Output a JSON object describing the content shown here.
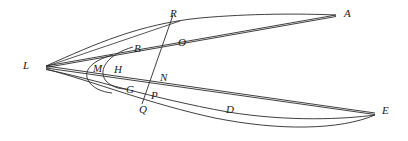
{
  "figure": {
    "kind": "geometry-diagram",
    "width": 408,
    "height": 141,
    "stroke_color": "#2b2b2b",
    "background_color": "#ffffff",
    "label_color": "#1a1a1a"
  },
  "points": [
    {
      "id": "A",
      "label": "A",
      "label_x": 344,
      "label_y": 8,
      "x": 336,
      "y": 15
    },
    {
      "id": "R",
      "label": "R",
      "label_x": 170,
      "label_y": 8,
      "x": 172,
      "y": 22
    },
    {
      "id": "O",
      "label": "O",
      "label_x": 178,
      "label_y": 37,
      "x": 175,
      "y": 38
    },
    {
      "id": "B",
      "label": "B",
      "label_x": 134,
      "label_y": 43,
      "x": 131,
      "y": 49
    },
    {
      "id": "L",
      "label": "L",
      "label_x": 23,
      "label_y": 60,
      "x": 46,
      "y": 66
    },
    {
      "id": "M",
      "label": "M",
      "label_x": 95,
      "label_y": 63,
      "x": 94,
      "y": 68
    },
    {
      "id": "H",
      "label": "H",
      "label_x": 115,
      "label_y": 64,
      "x": 114,
      "y": 69
    },
    {
      "id": "N",
      "label": "N",
      "label_x": 160,
      "label_y": 72,
      "x": 158,
      "y": 76
    },
    {
      "id": "G",
      "label": "G",
      "label_x": 126,
      "label_y": 84,
      "x": 125,
      "y": 89
    },
    {
      "id": "P",
      "label": "P",
      "label_x": 151,
      "label_y": 90,
      "x": 150,
      "y": 90
    },
    {
      "id": "Q",
      "label": "Q",
      "label_x": 139,
      "label_y": 104,
      "x": 143,
      "y": 101
    },
    {
      "id": "D",
      "label": "D",
      "label_x": 226,
      "label_y": 104,
      "x": 228,
      "y": 112
    },
    {
      "id": "E",
      "label": "E",
      "label_x": 382,
      "label_y": 105,
      "x": 375,
      "y": 113
    }
  ],
  "curves": [
    {
      "id": "upper-outer-arc",
      "name": "arc-L-B-R-A",
      "d": "M 46 66 Q 170 8 336 15"
    },
    {
      "id": "upper-chord-A",
      "name": "line-L-A",
      "d": "M 46 66 L 336 15"
    },
    {
      "id": "upper-chord-O",
      "name": "line-L-O-A",
      "d": "M 46 66 L 336 16"
    },
    {
      "id": "inner-arc-B-G",
      "name": "arc-B-H-G",
      "d": "M 131 49 Q 95 72 125 89"
    },
    {
      "id": "inner-arc-M",
      "name": "arc-M-small",
      "d": "M 112 56 Q 78 70 110 92"
    },
    {
      "id": "transversal-R-Q",
      "name": "line-R-O-N-P-Q",
      "d": "M 172 17 L 143 103"
    },
    {
      "id": "lower-chord-N-E",
      "name": "line-L-N-E",
      "d": "M 46 66 L 375 113"
    },
    {
      "id": "lower-line-Q-D-E",
      "name": "line-L-Q-D-E",
      "d": "M 46 68 L 375 114"
    },
    {
      "id": "lower-outer-arc",
      "name": "arc-L-Q-D-E",
      "d": "M 46 69 Q 215 150 375 115"
    }
  ],
  "legend": {
    "title": "",
    "entries": []
  }
}
